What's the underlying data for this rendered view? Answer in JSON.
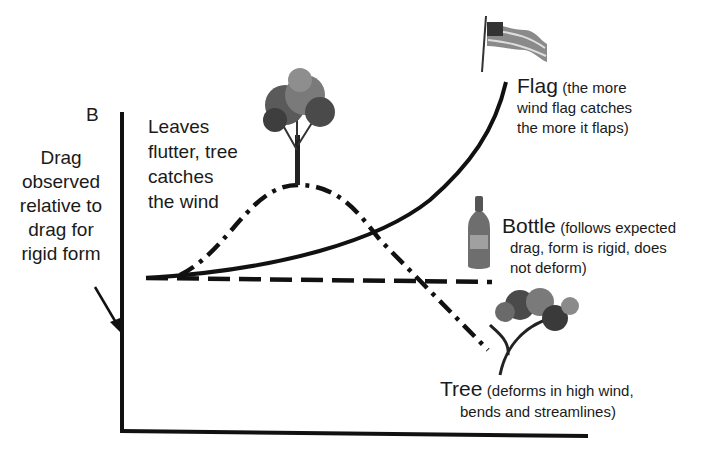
{
  "panel": {
    "letter": "B"
  },
  "axes": {
    "ylabel_lines": [
      "Drag",
      "observed",
      "relative to",
      "drag for",
      "rigid form"
    ]
  },
  "annotations": {
    "leaves": [
      "Leaves",
      "flutter, tree",
      "catches",
      "the wind"
    ],
    "flag": {
      "name": "Flag",
      "desc_lines": [
        "(the more",
        "wind flag catches",
        "the more it flaps)"
      ]
    },
    "bottle": {
      "name": "Bottle",
      "desc_lines": [
        "(follows expected",
        "drag, form is rigid, does",
        "not deform)"
      ]
    },
    "tree": {
      "name": "Tree",
      "desc_lines": [
        "(deforms in high wind,",
        "bends and streamlines)"
      ]
    }
  },
  "icons": [
    "flag-icon",
    "bottle-icon",
    "upright-tree-icon",
    "bent-tree-icon"
  ],
  "series": [
    {
      "name": "Flag",
      "style": "solid",
      "color": "#111111"
    },
    {
      "name": "Bottle",
      "style": "dashed",
      "color": "#111111"
    },
    {
      "name": "Tree",
      "style": "dash-dot",
      "color": "#111111"
    }
  ]
}
